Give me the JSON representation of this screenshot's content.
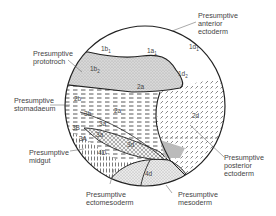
{
  "diagram": {
    "type": "embryo-fate-map",
    "labels": {
      "anterior_ectoderm": "Presumptive\nanterior\nectoderm",
      "prototroch": "Presumptive\nprototroch",
      "stomadaeum": "Presumptive\nstomadaeum",
      "midgut": "Presumptive\nmidgut",
      "ectomesoderm": "Presumptive\nectomesoderm",
      "mesoderm": "Presumptive\nmesoderm",
      "posterior_ectoderm": "Presumptive\nposterior\nectoderm"
    },
    "regions": {
      "r1b1": "1b",
      "r1b1_sub": "1",
      "r1a1": "1a",
      "r1a1_sub": "1",
      "r1d1": "1d",
      "r1d1_sub": "1",
      "r1b2": "1b",
      "r1b2_sub": "2",
      "r1d2": "1d",
      "r1d2_sub": "2",
      "r2a_top": "2a",
      "r2b": "2b",
      "r2a_mid": "2a",
      "r3b": "3b",
      "r3a_upper": "3a",
      "r3B": "3B",
      "r3A": "3A",
      "r3a_lower": "3a",
      "r3d": "3d",
      "r4D": "4D",
      "r4d": "4d",
      "r2d": "2d"
    }
  }
}
